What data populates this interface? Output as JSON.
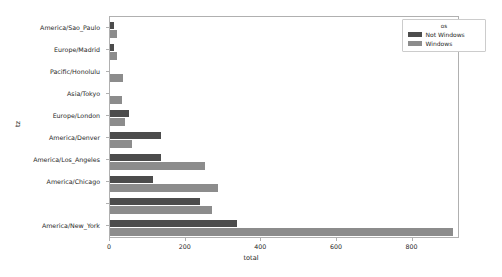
{
  "chart_data": {
    "type": "bar",
    "orientation": "horizontal",
    "title": "",
    "xlabel": "total",
    "ylabel": "tz",
    "xlim": [
      0,
      920
    ],
    "ylim_categories": 9,
    "grid": false,
    "legend": {
      "title": "os",
      "position": "upper right",
      "entries": [
        {
          "name": "Not Windows",
          "color": "#4c4c4c"
        },
        {
          "name": "Windows",
          "color": "#8c8c8c"
        }
      ]
    },
    "xticks": [
      0,
      200,
      400,
      600,
      800
    ],
    "xtick_labels": [
      "0",
      "200",
      "400",
      "600",
      "800"
    ],
    "categories": [
      "America/Sao_Paulo",
      "Europe/Madrid",
      "Pacific/Honolulu",
      "Asia/Tokyo",
      "Europe/London",
      "America/Denver",
      "America/Los_Angeles",
      "America/Chicago",
      "",
      "America/New_York"
    ],
    "series": [
      {
        "name": "Not Windows",
        "color": "#4c4c4c",
        "values": [
          10,
          10,
          0,
          0,
          50,
          134,
          136,
          113,
          239,
          336
        ]
      },
      {
        "name": "Windows",
        "color": "#8c8c8c",
        "values": [
          18,
          18,
          34,
          31,
          39,
          58,
          252,
          286,
          270,
          908
        ]
      }
    ]
  }
}
